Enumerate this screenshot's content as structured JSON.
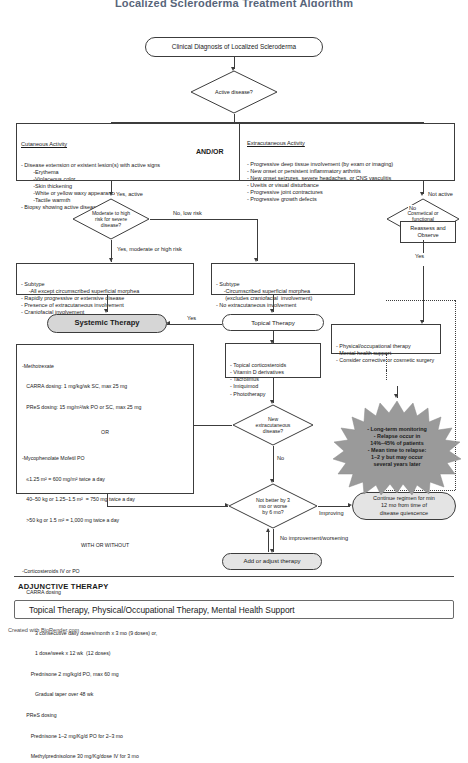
{
  "page": {
    "title": "Localized Scleroderma Treatment Algorithm",
    "credit": "Created with BioRender.com"
  },
  "nodes": {
    "start": {
      "label": "Clinical Diagnosis of Localized Scleroderma"
    },
    "active_disease": {
      "label": "Active disease?"
    },
    "cutaneous": {
      "heading": "Cutaneous Activity",
      "body": "- Disease extension or existent lesion(s) with active signs\n        -Erythema\n        -Violaceous color\n        -Skin thickening\n        -White or yellow waxy appearance\n        -Tactile warmth\n- Biopsy showing active disease"
    },
    "andor": {
      "label": "AND/OR"
    },
    "extracutaneous": {
      "heading": "Extracutaneous Activity",
      "body": "- Progressive deep tissue involvement (by exam or imaging)\n- New onset or persistent inflammatory arthritis\n- New onset seizures, severe headaches, or CNS vasculitis\n- Uveitis or visual disturbance\n- Progressive joint contractures\n- Progressive growth defects"
    },
    "risk": {
      "label": "Moderate to high\nrisk for severe\ndisease?"
    },
    "cosmetic": {
      "label": "Cosmetical or\nfunctional\nissues?"
    },
    "reassess": {
      "label": "Reassess and\nObserve"
    },
    "subtype_systemic": {
      "body": "- Subtype\n     -All except circumscribed superficial morphea\n- Rapidly progressive or extensive disease\n- Presence of extracutaneous involvement\n- Craniofacial involvement"
    },
    "subtype_topical": {
      "body": "- Subtype\n     -Circumscribed superficial morphea\n      (excludes craniofacial  involvement)\n- No extracutaneous involvement"
    },
    "systemic_therapy": {
      "label": "Systemic Therapy"
    },
    "topical_therapy": {
      "label": "Topical Therapy"
    },
    "topical_list": {
      "body": "- Topical corticosteroids\n- Vitamin D derivatives\n- Tacrolimus\n- Imiquimod\n- Phototherapy"
    },
    "supportive": {
      "body": "- Physical/occupational therapy\n- Mental health support\n- Consider corrective or cosmetic surgery"
    },
    "systemic_regimen": {
      "line1": "-Methotrexate",
      "line2": "   CARRA dosing: 1 mg/kg/wk SC, max 25 mg",
      "line3": "   PReS dosing: 15 mg/m²/wk PO or SC, max 25 mg",
      "or": "OR",
      "line4": "-Mycophenolate Mofetil PO",
      "line5": "   ≤1.25 m² = 600 mg/m² twice a day",
      "line6": "   40–50 kg or 1.25–1.5 m²  = 750 mg twice a day",
      "line7": "   >50 kg or 1.5 m² = 1,000 mg twice a day",
      "withwithout": "WITH OR WITHOUT",
      "line8": "-Corticosteroids IV or PO",
      "line9": "   CARRA dosing",
      "line10": "      Methylprednisolone 30 mg/kg/dose IV (max 1 gm)",
      "line11": "         3 consecutive daily doses/month x 3 mo (9 doses) or,",
      "line12": "         1 dose/week x 12 wk  (12 doses)",
      "line13": "      Prednisone 2 mg/kg/d PO, max 60 mg",
      "line14": "         Gradual taper over 48 wk",
      "line15": "   PReS dosing",
      "line16": "      Prednisone 1–2 mg/Kg/d PO for 2–3 mo",
      "line17": "      Methylprednisolone 30 mg/Kg/dose IV for 3 mo"
    },
    "new_extracutaneous": {
      "label": "New\nextracutaneous\ndisease?"
    },
    "not_better": {
      "label": "Not better by 3\nmo or worse\nby 6 mo?"
    },
    "continue_regimen": {
      "label": "Continue regimen for min\n12 mo from time of\ndisease quiescence"
    },
    "monitoring_burst": {
      "body": "- Long-term monitoring\n- Relapse occur in\n14%–45% of patients\n- Mean time to relapse:\n1–2 y but may occur\nseveral years later"
    },
    "add_adjust": {
      "label": "Add or adjust therapy"
    }
  },
  "edges": {
    "yes_active": "Yes, active",
    "not_active": "Not active",
    "no_low_risk": "No, low risk",
    "yes_moderate_high": "Yes, moderate or high risk",
    "yes_cosmetic": "Yes",
    "no_cosmetic": "No",
    "yes_topical_to_systemic": "Yes",
    "no_new_extra": "No",
    "improving": "Improving",
    "no_improvement": "No improvement/worsening"
  },
  "adjunctive": {
    "title": "ADJUNCTIVE THERAPY",
    "banner": "Topical Therapy, Physical/Occupational Therapy, Mental Health Support"
  },
  "colors": {
    "stroke": "#3c3c3c",
    "shaded_fill": "#d6d6d6",
    "burst_fill": "#9a9a9a",
    "title_color": "#3a4a63"
  }
}
